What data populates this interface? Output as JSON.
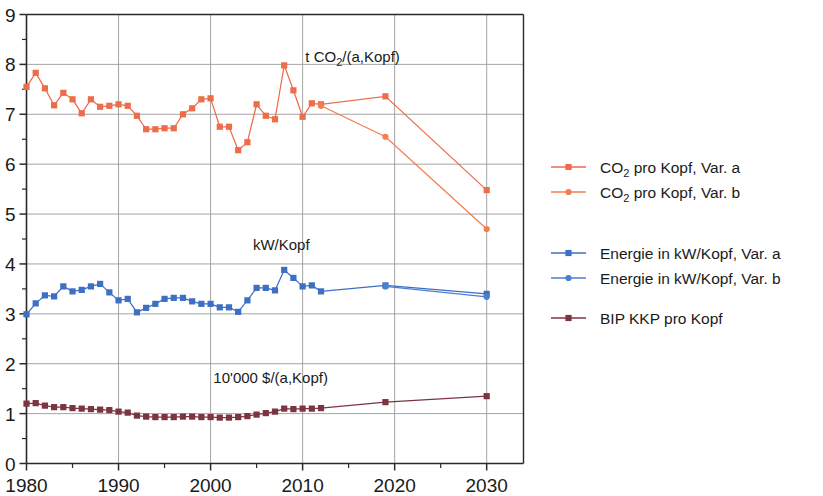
{
  "chart_data": {
    "type": "line",
    "title": "",
    "xlabel": "",
    "ylabel": "",
    "xlim": [
      1980,
      2034
    ],
    "ylim": [
      0,
      9
    ],
    "xticks": [
      1980,
      1990,
      2000,
      2010,
      2020,
      2030
    ],
    "xticklabels": [
      "1980",
      "1990",
      "2000",
      "2010",
      "2020",
      "2030"
    ],
    "xminorticks": [
      1985,
      1995,
      2005,
      2015,
      2025
    ],
    "yticks": [
      0,
      1,
      2,
      3,
      4,
      5,
      6,
      7,
      8,
      9
    ],
    "yticklabels": [
      "0",
      "1",
      "2",
      "3",
      "4",
      "5",
      "6",
      "7",
      "8",
      "9"
    ],
    "yminorticks": [
      0.5,
      1.5,
      2.5,
      3.5,
      4.5,
      5.5,
      6.5,
      7.5,
      8.5
    ],
    "grid": true,
    "legend_position": "right",
    "annotations": [
      {
        "name": "co2-unit-label",
        "text_pre": "t CO",
        "text_sub": "2",
        "text_post": "/(a,Kopf)",
        "x": 2010.3,
        "y": 8.05
      },
      {
        "name": "energy-unit-label",
        "text_pre": "kW/Kopf",
        "text_sub": "",
        "text_post": "",
        "x": 2004.6,
        "y": 4.27
      },
      {
        "name": "gdp-unit-label",
        "text_pre": "10'000 $/(a,Kopf)",
        "text_sub": "",
        "text_post": "",
        "x": 2000.3,
        "y": 1.62
      }
    ],
    "series": [
      {
        "name": "CO2 pro Kopf, Var. a",
        "legend_pre": "CO",
        "legend_sub": "2",
        "legend_post": " pro Kopf, Var. a",
        "color": "#ED6D4A",
        "marker": "square",
        "x": [
          1980,
          1981,
          1982,
          1983,
          1984,
          1985,
          1986,
          1987,
          1988,
          1989,
          1990,
          1991,
          1992,
          1993,
          1994,
          1995,
          1996,
          1997,
          1998,
          1999,
          2000,
          2001,
          2002,
          2003,
          2004,
          2005,
          2006,
          2007,
          2008,
          2009,
          2010,
          2011,
          2012,
          2019,
          2030
        ],
        "values": [
          7.55,
          7.83,
          7.52,
          7.18,
          7.43,
          7.3,
          7.02,
          7.3,
          7.15,
          7.17,
          7.2,
          7.17,
          6.97,
          6.7,
          6.7,
          6.72,
          6.72,
          7.0,
          7.12,
          7.3,
          7.32,
          6.75,
          6.75,
          6.28,
          6.44,
          7.2,
          6.97,
          6.9,
          7.98,
          7.48,
          6.95,
          7.22,
          7.2,
          7.36,
          5.48
        ]
      },
      {
        "name": "CO2 pro Kopf, Var. b",
        "legend_pre": "CO",
        "legend_sub": "2",
        "legend_post": " pro Kopf, Var. b",
        "color": "#F27F4D",
        "marker": "circle",
        "x": [
          2012,
          2019,
          2030
        ],
        "values": [
          7.17,
          6.55,
          4.7
        ]
      },
      {
        "name": "Energie in kW/Kopf, Var. a",
        "legend_pre": "Energie in kW/Kopf, Var. a",
        "legend_sub": "",
        "legend_post": "",
        "color": "#3D6FC4",
        "marker": "square",
        "x": [
          1980,
          1981,
          1982,
          1983,
          1984,
          1985,
          1986,
          1987,
          1988,
          1989,
          1990,
          1991,
          1992,
          1993,
          1994,
          1995,
          1996,
          1997,
          1998,
          1999,
          2000,
          2001,
          2002,
          2003,
          2004,
          2005,
          2006,
          2007,
          2008,
          2009,
          2010,
          2011,
          2012,
          2019,
          2030
        ],
        "values": [
          2.99,
          3.21,
          3.37,
          3.35,
          3.55,
          3.45,
          3.48,
          3.55,
          3.6,
          3.43,
          3.27,
          3.3,
          3.03,
          3.12,
          3.2,
          3.3,
          3.32,
          3.32,
          3.25,
          3.2,
          3.2,
          3.13,
          3.13,
          3.04,
          3.27,
          3.52,
          3.52,
          3.47,
          3.88,
          3.72,
          3.55,
          3.57,
          3.45,
          3.57,
          3.4
        ]
      },
      {
        "name": "Energie in kW/Kopf, Var. b",
        "legend_pre": "Energie in kW/Kopf, Var. b",
        "legend_sub": "",
        "legend_post": "",
        "color": "#4A7FD4",
        "marker": "circle",
        "x": [
          2019,
          2030
        ],
        "values": [
          3.55,
          3.34
        ]
      },
      {
        "name": "BIP KKP pro Kopf",
        "legend_pre": "BIP KKP pro Kopf",
        "legend_sub": "",
        "legend_post": "",
        "color": "#7B3440",
        "marker": "square",
        "x": [
          1980,
          1981,
          1982,
          1983,
          1984,
          1985,
          1986,
          1987,
          1988,
          1989,
          1990,
          1991,
          1992,
          1993,
          1994,
          1995,
          1996,
          1997,
          1998,
          1999,
          2000,
          2001,
          2002,
          2003,
          2004,
          2005,
          2006,
          2007,
          2008,
          2009,
          2010,
          2011,
          2012,
          2019,
          2030
        ],
        "values": [
          1.2,
          1.21,
          1.16,
          1.13,
          1.13,
          1.11,
          1.1,
          1.09,
          1.08,
          1.07,
          1.04,
          1.02,
          0.96,
          0.94,
          0.93,
          0.93,
          0.93,
          0.94,
          0.94,
          0.93,
          0.93,
          0.92,
          0.92,
          0.93,
          0.95,
          0.98,
          1.01,
          1.04,
          1.1,
          1.09,
          1.1,
          1.1,
          1.11,
          1.23,
          1.35
        ]
      }
    ]
  },
  "legend": {
    "items": [
      {
        "label": "CO2 pro Kopf, Var. a",
        "series_index": 0
      },
      {
        "label": "CO2 pro Kopf, Var. b",
        "series_index": 1
      },
      {
        "label": "Energie in kW/Kopf, Var. a",
        "series_index": 2
      },
      {
        "label": "Energie in kW/Kopf, Var. b",
        "series_index": 3
      },
      {
        "label": "BIP KKP pro Kopf",
        "series_index": 4
      }
    ]
  }
}
